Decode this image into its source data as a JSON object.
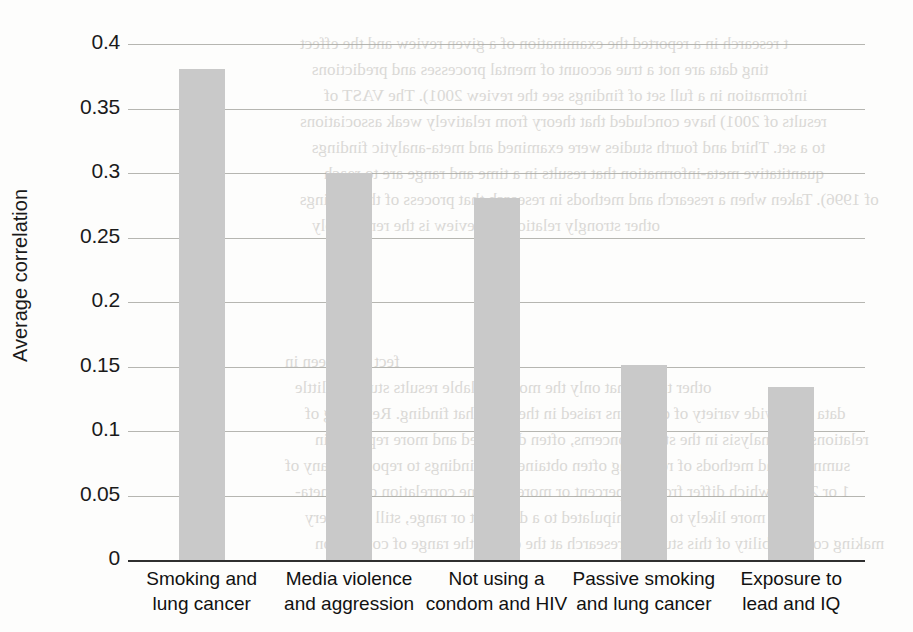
{
  "chart_data": {
    "type": "bar",
    "title": "",
    "subtitle": "",
    "xlabel": "",
    "ylabel": "Average correlation",
    "categories": [
      "Smoking and lung cancer",
      "Media violence and aggression",
      "Not using a condom and HIV",
      "Passive smoking and lung cancer",
      "Exposure to lead and IQ"
    ],
    "category_lines": [
      [
        "Smoking and",
        "lung cancer"
      ],
      [
        "Media violence",
        "and aggression"
      ],
      [
        "Not using a",
        "condom and HIV"
      ],
      [
        "Passive smoking",
        "and lung cancer"
      ],
      [
        "Exposure to",
        "lead and IQ"
      ]
    ],
    "values": [
      0.381,
      0.3,
      0.281,
      0.151,
      0.134
    ],
    "ylim": [
      0,
      0.4
    ],
    "ytick_values": [
      0,
      0.05,
      0.1,
      0.15,
      0.2,
      0.25,
      0.3,
      0.35,
      0.4
    ],
    "ytick_labels": [
      "0",
      "0.05",
      "0.1",
      "0.15",
      "0.2",
      "0.25",
      "0.3",
      "0.35",
      "0.4"
    ],
    "grid": true,
    "legend": false,
    "bar_color": "#c9c9c9",
    "gridline_color": "#a9a9a3",
    "axis_color": "#2f2f2f",
    "text_color": "#1a1a1a"
  },
  "artifact": {
    "description": "faint mirrored bleed-through text from reverse of scanned book page",
    "lines": [
      "t research in a reported the examination of a given review and the effect",
      "ting data are not a true account of mental processes and predictions",
      "information in a full set of findings see the review 2001). The VAST of",
      "results of 2001) have concluded that theory from relatively weak associations",
      "to a set. Third and fourth studies were examined and meta-analytic findings",
      "quantitative meta-information that results in a time and range are to reach",
      "of 1996). Taken when a research and methods in research that process of the findings",
      "other strongly relations to review is the remarkably"
    ],
    "lines_lower": [
      "fect sizes seen in",
      "other terms that only the most available results studies a little",
      "data for a wide variety of questions raised in the field that finding. Reporting of",
      "relations and analysis in the study concerns, often discussed and more reported in",
      "summary and methods of reporting often obtained the findings to report that any of",
      "1 or 2003), which differ from 10 percent or more to some correlation of the meta-",
      "which more likely to be manipulated to a different or range, still its is very",
      "making comparability of this study of research at the end of the range of correlation"
    ]
  }
}
